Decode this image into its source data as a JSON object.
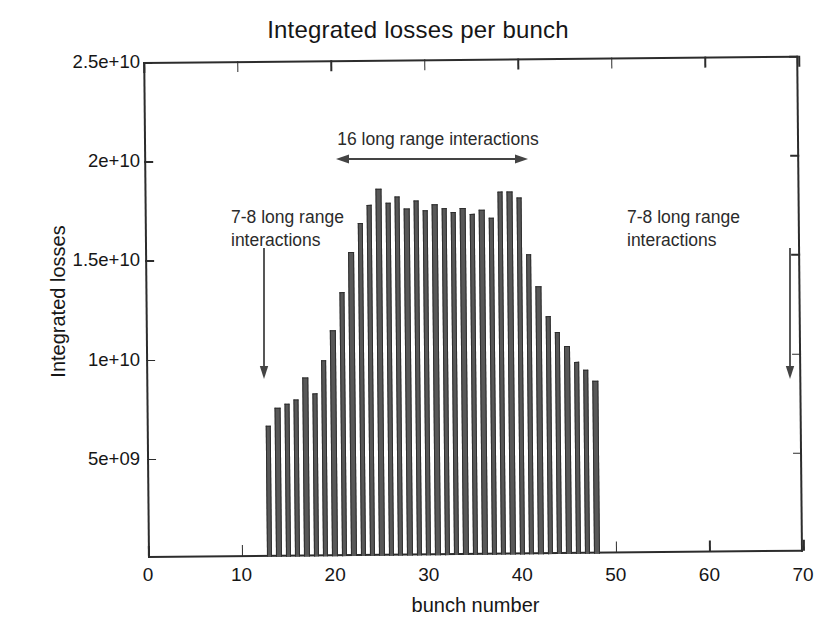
{
  "chart_data": {
    "type": "bar",
    "title": "Integrated losses per bunch",
    "xlabel": "bunch number",
    "ylabel": "Integrated losses",
    "xlim": [
      0,
      70
    ],
    "ylim": [
      0,
      25000000000
    ],
    "grid": false,
    "legend": null,
    "bar_color": "#585858",
    "axis_color": "#2c2c2c",
    "xticks": [
      0,
      10,
      20,
      30,
      40,
      50,
      60,
      70
    ],
    "xtick_labels": [
      "0",
      "10",
      "20",
      "30",
      "40",
      "50",
      "60",
      "70"
    ],
    "yticks": [
      5000000000,
      10000000000,
      15000000000,
      20000000000,
      25000000000
    ],
    "ytick_labels": [
      "5e+09",
      "1e+10",
      "1.5e+10",
      "2e+10",
      "2.5e+10"
    ],
    "x": [
      13,
      14,
      15,
      16,
      17,
      18,
      19,
      20,
      21,
      22,
      23,
      24,
      25,
      26,
      27,
      28,
      29,
      30,
      31,
      32,
      33,
      34,
      35,
      36,
      37,
      38,
      39,
      40,
      41,
      42,
      43,
      44,
      45,
      46,
      47,
      48
    ],
    "values": [
      6600000000,
      7500000000,
      7700000000,
      7900000000,
      9000000000,
      8200000000,
      9900000000,
      11400000000,
      13300000000,
      15300000000,
      16800000000,
      17700000000,
      18500000000,
      17800000000,
      18100000000,
      17500000000,
      17900000000,
      17400000000,
      17700000000,
      17500000000,
      17300000000,
      17500000000,
      17200000000,
      17400000000,
      17000000000,
      18300000000,
      18300000000,
      18000000000,
      15100000000,
      13500000000,
      12000000000,
      11200000000,
      10500000000,
      9700000000,
      9300000000,
      8700000000
    ],
    "annotations": [
      {
        "name": "left-annotation",
        "text": "7-8 long range interactions",
        "arrow": "down",
        "x_target": 13
      },
      {
        "name": "span-annotation",
        "text": "16 long range interactions",
        "arrow": "double",
        "x_from": 20,
        "x_to": 40
      },
      {
        "name": "right-annotation",
        "text": "7-8 long range interactions",
        "arrow": "down",
        "x_target": 48
      }
    ]
  },
  "annotations": {
    "left_line1": "7-8 long range",
    "left_line2": "interactions",
    "right_line1": "7-8 long range",
    "right_line2": "interactions",
    "span_label": "16 long range interactions"
  }
}
